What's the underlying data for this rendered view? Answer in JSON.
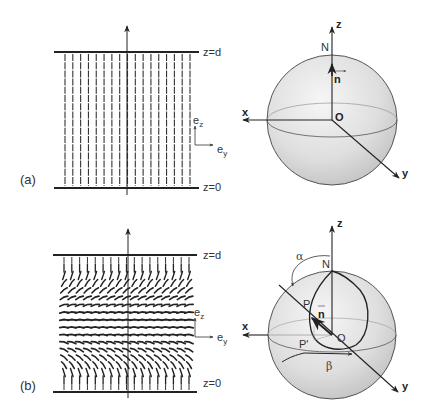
{
  "figure": {
    "panels": [
      {
        "id": "a",
        "label": "(a)",
        "plate_top_label": "z=d",
        "plate_bottom_label": "z=0",
        "basis": {
          "ez": "e",
          "ez_sub": "z",
          "ey": "e",
          "ey_sub": "y"
        },
        "director_columns": 17,
        "director_state": "uniform-vertical",
        "sphere": {
          "axis_z": "z",
          "axis_x": "x",
          "axis_y": "y",
          "north": "N",
          "origin": "O",
          "director": "n"
        }
      },
      {
        "id": "b",
        "label": "(b)",
        "plate_top_label": "z=d",
        "plate_bottom_label": "z=0",
        "basis": {
          "ez": "e",
          "ez_sub": "z",
          "ey": "e",
          "ey_sub": "y"
        },
        "director_columns": 17,
        "director_rows": 16,
        "director_state": "twisted-distorted",
        "sphere": {
          "axis_z": "z",
          "axis_x": "x",
          "axis_y": "y",
          "north": "N",
          "origin": "O",
          "director": "n",
          "point_p": "P",
          "point_p_proj": "P'",
          "angle_alpha": "α",
          "angle_beta": "β"
        }
      }
    ],
    "colors": {
      "ink": "#222222",
      "sphere_light": "#f2f2f2",
      "sphere_dark": "#c4c4c4",
      "thin_line": "#777777"
    }
  }
}
